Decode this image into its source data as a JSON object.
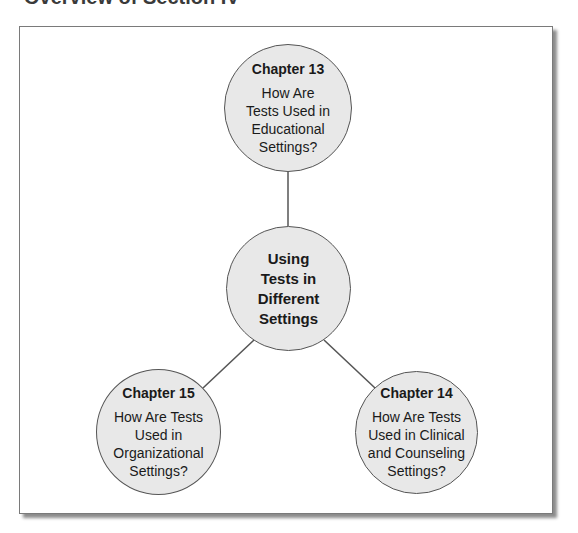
{
  "heading": "Overview of Section IV",
  "colors": {
    "node_fill": "#e8e8e8",
    "node_stroke": "#555555",
    "connector": "#555555",
    "frame_border": "#7a7a7a"
  },
  "diagram": {
    "center": {
      "lines": [
        "Using",
        "Tests in",
        "Different",
        "Settings"
      ]
    },
    "nodes": [
      {
        "chapter": "Chapter 13",
        "lines": [
          "How Are",
          "Tests Used in",
          "Educational",
          "Settings?"
        ],
        "position": "top"
      },
      {
        "chapter": "Chapter 15",
        "lines": [
          "How Are Tests",
          "Used in",
          "Organizational",
          "Settings?"
        ],
        "position": "bottom-left"
      },
      {
        "chapter": "Chapter 14",
        "lines": [
          "How Are Tests",
          "Used in Clinical",
          "and Counseling",
          "Settings?"
        ],
        "position": "bottom-right"
      }
    ]
  }
}
